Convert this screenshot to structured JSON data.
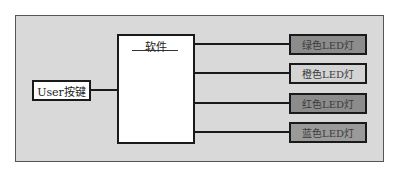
{
  "diagram": {
    "type": "block-diagram",
    "input": {
      "label": "User按键",
      "fill": "#ffffff"
    },
    "processor": {
      "label": "软件",
      "fill": "#ffffff"
    },
    "outputs": [
      {
        "label": "绿色LED灯",
        "fill": "#8c8c8c",
        "text_color": "#3a3a3a"
      },
      {
        "label": "橙色LED灯",
        "fill": "#d4d4d4",
        "text_color": "#3a3a3a"
      },
      {
        "label": "红色LED灯",
        "fill": "#8c8c8c",
        "text_color": "#3a3a3a"
      },
      {
        "label": "蓝色LED灯",
        "fill": "#9a9a9a",
        "text_color": "#3a3a3a"
      }
    ],
    "edges": [
      {
        "from": "User按键",
        "to": "软件"
      },
      {
        "from": "软件",
        "to": "绿色LED灯"
      },
      {
        "from": "软件",
        "to": "橙色LED灯"
      },
      {
        "from": "软件",
        "to": "红色LED灯"
      },
      {
        "from": "软件",
        "to": "蓝色LED灯"
      }
    ],
    "background": "#d9d9d9"
  }
}
